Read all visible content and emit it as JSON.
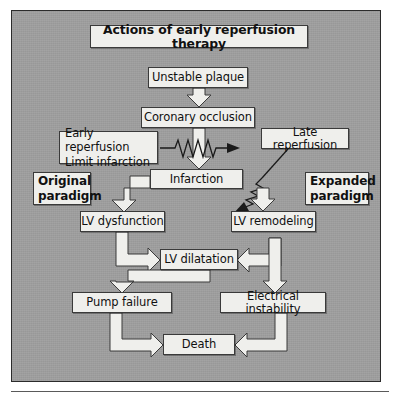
{
  "figure": {
    "title": "Actions of early reperfusion therapy",
    "background_color": "#9d9d9d",
    "node_fill_color": "#efefec",
    "border_color": "#2b2b2b"
  },
  "nodes": {
    "title": "Actions of early reperfusion therapy",
    "unstable_plaque": "Unstable plaque",
    "coronary_occlusion": "Coronary occlusion",
    "early_reperfusion_line1": "Early reperfusion",
    "early_reperfusion_line2": "Limit infarction",
    "late_reperfusion": "Late reperfusion",
    "original_paradigm_line1": "Original",
    "original_paradigm_line2": "paradigm",
    "expanded_paradigm_line1": "Expanded",
    "expanded_paradigm_line2": "paradigm",
    "infarction": "Infarction",
    "lv_dysfunction": "LV dysfunction",
    "lv_remodeling": "LV remodeling",
    "lv_dilatation": "LV dilatation",
    "pump_failure": "Pump failure",
    "electrical_instability": "Electrical instability",
    "death": "Death"
  },
  "edges": [
    {
      "from": "unstable_plaque",
      "to": "coronary_occlusion",
      "style": "block-arrow-down"
    },
    {
      "from": "coronary_occlusion",
      "to": "infarction",
      "style": "block-arrow-down"
    },
    {
      "from": "early_reperfusion",
      "to": "coronary_occlusion_shaft",
      "style": "thin-zigzag-arrow-right"
    },
    {
      "from": "late_reperfusion",
      "to": "infarction_right",
      "style": "thin-line-zigzag-arrow-downleft"
    },
    {
      "from": "infarction",
      "to": "lv_dysfunction",
      "style": "block-elbow-left-down"
    },
    {
      "from": "infarction",
      "to": "lv_remodeling",
      "style": "block-arrow-down"
    },
    {
      "from": "lv_dysfunction",
      "to": "lv_dilatation",
      "style": "block-elbow-down-right"
    },
    {
      "from": "lv_remodeling",
      "to": "lv_dilatation",
      "style": "block-elbow-left"
    },
    {
      "from": "lv_remodeling",
      "to": "electrical_instability",
      "style": "block-arrow-down"
    },
    {
      "from": "lv_dilatation",
      "to": "pump_failure",
      "style": "block-elbow-left-down"
    },
    {
      "from": "pump_failure",
      "to": "death",
      "style": "block-elbow-down-right"
    },
    {
      "from": "electrical_instability",
      "to": "death",
      "style": "block-elbow-down-left"
    }
  ]
}
